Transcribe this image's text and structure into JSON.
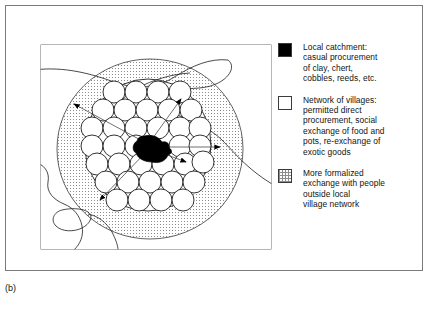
{
  "figure": {
    "caption": "(b)",
    "panel_border_color": "#7a7a7a"
  },
  "legend": {
    "items": [
      {
        "swatch": "solid-black-square",
        "swatch_style": "solid",
        "swatch_color": "#000000",
        "text": "Local catchment:\ncasual procurement\nof clay, chert,\ncobbles, reeds, etc."
      },
      {
        "swatch": "empty-white-square",
        "swatch_style": "empty",
        "swatch_color": "#ffffff",
        "text": "Network of villages:\npermitted direct\nprocurement, social\nexchange of food and\npots, re-exchange of\nexotic goods"
      },
      {
        "swatch": "stippled-square",
        "swatch_style": "stipple",
        "swatch_color": "#8d8d8d",
        "text": "More formalized\nexchange with people\noutside local\nvillage network"
      }
    ]
  },
  "diagram": {
    "zones": [
      {
        "name": "outer-formalized-exchange-zone",
        "style": "stippled",
        "shape": "large-ellipse"
      },
      {
        "name": "village-network-zone",
        "style": "white-with-circles",
        "shape": "inner-ellipse"
      },
      {
        "name": "local-catchment-core",
        "style": "solid-black",
        "shape": "irregular-blob"
      }
    ],
    "village_circle_count": 34,
    "arrow_count": 5,
    "landscape_features": [
      "coastline",
      "river",
      "lake-inlet"
    ],
    "colors": {
      "stipple": "#8d8d8d",
      "outline": "#1c1c1c",
      "core": "#000000",
      "background": "#ffffff"
    }
  }
}
